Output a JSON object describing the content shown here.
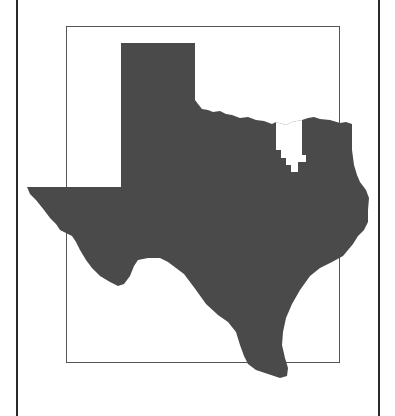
{
  "map": {
    "subject": "Texas state outline",
    "highlighted_region": "Northeast Texas county cluster (shown white)",
    "colors": {
      "state_fill": "#4a4a4a",
      "highlight_fill": "#ffffff",
      "frame_stroke": "#555555",
      "outer_frame_stroke": "#2a2a2a",
      "background": "#ffffff"
    }
  }
}
